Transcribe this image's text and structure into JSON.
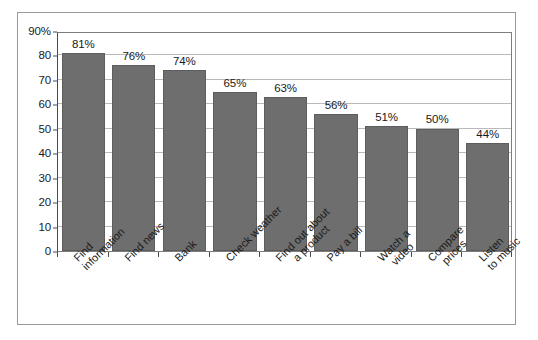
{
  "chart_data": {
    "type": "bar",
    "title": "",
    "subtitle": "",
    "xlabel": "",
    "ylabel": "",
    "categories": [
      "Find information",
      "Find news",
      "Bank",
      "Check weather",
      "Find out about a product",
      "Pay a bill",
      "Watch a video",
      "Compare prices",
      "Listen to music"
    ],
    "category_lines": [
      [
        "Find",
        "information"
      ],
      [
        "Find news",
        ""
      ],
      [
        "Bank",
        ""
      ],
      [
        "Check weather",
        ""
      ],
      [
        "Find out about",
        "a product"
      ],
      [
        "Pay a bill",
        ""
      ],
      [
        "Watch a",
        "video"
      ],
      [
        "Compare",
        "prices"
      ],
      [
        "Listen",
        "to music"
      ]
    ],
    "values": [
      81,
      76,
      74,
      65,
      63,
      56,
      51,
      50,
      44
    ],
    "data_labels": [
      "81%",
      "76%",
      "74%",
      "65%",
      "63%",
      "56%",
      "51%",
      "50%",
      "44%"
    ],
    "ylim": [
      0,
      90
    ],
    "ytick_values": [
      0,
      10,
      20,
      30,
      40,
      50,
      60,
      70,
      80,
      90
    ],
    "ytick_labels": [
      "0",
      "10",
      "20",
      "30",
      "40",
      "50",
      "60",
      "70",
      "80",
      "90%"
    ],
    "grid": true,
    "legend": false,
    "bar_color": "#6e6e6e",
    "grid_color": "#b9b9b9",
    "axis_color": "#4a4a4a",
    "background_color": "#ffffff"
  },
  "caption": {
    "text": ""
  }
}
